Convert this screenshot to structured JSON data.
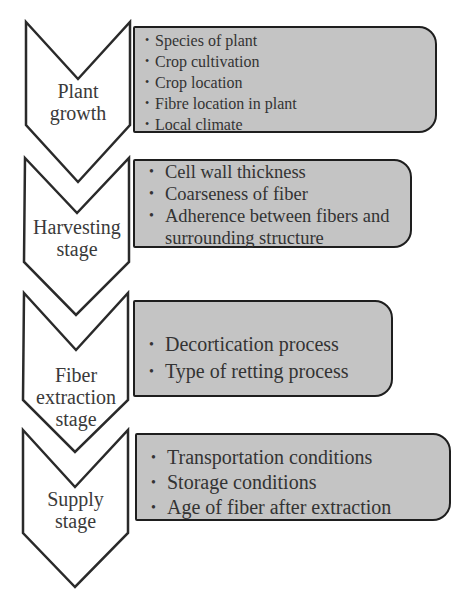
{
  "diagram": {
    "type": "process-flow",
    "colors": {
      "box_fill": "#c4c4c4",
      "box_border": "#1e1e1e",
      "chevron_stroke": "#2a2a2a",
      "background": "#ffffff"
    },
    "stages": [
      {
        "label_lines": [
          "Plant",
          "growth"
        ],
        "factors": [
          "Species of plant",
          "Crop cultivation",
          "Crop location",
          "Fibre location in plant",
          "Local climate"
        ]
      },
      {
        "label_lines": [
          "Harvesting",
          "stage"
        ],
        "factors": [
          "Cell wall thickness",
          "Coarseness of fiber",
          "Adherence between fibers and",
          "surrounding structure"
        ]
      },
      {
        "label_lines": [
          "Fiber",
          "extraction",
          "stage"
        ],
        "factors": [
          "Decortication process",
          "Type of retting process"
        ]
      },
      {
        "label_lines": [
          "Supply",
          "stage"
        ],
        "factors": [
          "Transportation conditions",
          "Storage conditions",
          "Age of fiber after extraction"
        ]
      }
    ]
  }
}
